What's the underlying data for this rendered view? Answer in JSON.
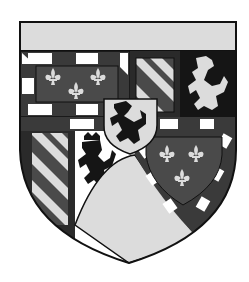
{
  "image": {
    "width": 249,
    "height": 282,
    "background": "#ffffff",
    "subject": "coat-of-arms"
  },
  "colors": {
    "outline": "#111111",
    "light": "#dcdcdc",
    "white": "#ffffff",
    "dark": "#3a3a3a",
    "black": "#151515",
    "mid": "#5a5a5a"
  },
  "quarters": [
    {
      "name": "chief",
      "tincture": "light-plain"
    },
    {
      "name": "fleur-de-lis-bordure-compony",
      "charges": "three fleurs-de-lis"
    },
    {
      "name": "bendy",
      "charges": "bends"
    },
    {
      "name": "lion-rampant-light-on-black"
    },
    {
      "name": "bendy-lower-left"
    },
    {
      "name": "lion-rampant-crowned-black-on-white"
    },
    {
      "name": "fleur-de-lis-bordure-compony-lower-right",
      "charges": "three fleurs-de-lis"
    },
    {
      "name": "escutcheon-lion-black-on-light"
    },
    {
      "name": "base-point-light"
    }
  ]
}
